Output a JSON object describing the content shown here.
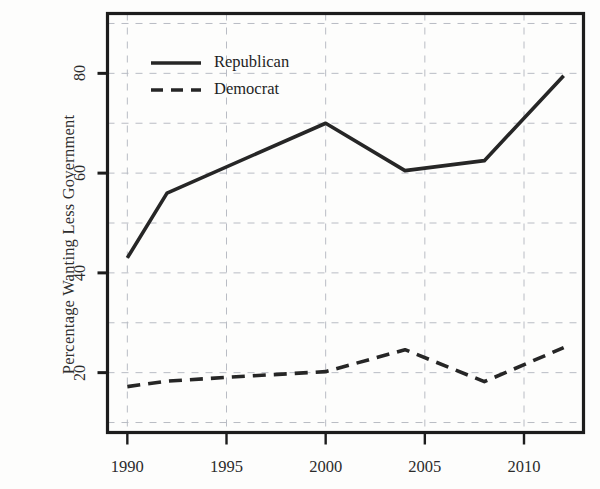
{
  "chart_data": {
    "type": "line",
    "title": "",
    "xlabel": "",
    "ylabel": "Percentage Wanting Less Government",
    "xlim": [
      1989,
      2013
    ],
    "ylim": [
      8,
      92
    ],
    "xticks": [
      1990,
      1995,
      2000,
      2005,
      2010
    ],
    "xtick_labels": [
      "1990",
      "1995",
      "2000",
      "2005",
      "2010"
    ],
    "yticks": [
      20,
      40,
      60,
      80
    ],
    "ytick_labels": [
      "20",
      "40",
      "60",
      "80"
    ],
    "gridlines_x": [
      1990,
      1995,
      2000,
      2005,
      2010
    ],
    "gridlines_y": [
      10,
      20,
      30,
      40,
      50,
      60,
      70,
      80,
      90
    ],
    "grid": true,
    "grid_style": "dashed",
    "grid_color": "#b9bcc4",
    "frame_color": "#1c1c1c",
    "legend_position": "top-left-inside",
    "series": [
      {
        "name": "Republican",
        "style": "solid",
        "color": "#262626",
        "x": [
          1990,
          1992,
          2000,
          2004,
          2008,
          2012
        ],
        "values": [
          43,
          56,
          70,
          60.5,
          62.5,
          79.5
        ]
      },
      {
        "name": "Democrat",
        "style": "dashed",
        "color": "#262626",
        "x": [
          1990,
          1992,
          1996,
          2000,
          2004,
          2008,
          2012
        ],
        "values": [
          17.2,
          18.3,
          19.3,
          20.2,
          24.6,
          18.2,
          25
        ]
      }
    ]
  },
  "legend": {
    "items": [
      {
        "label": "Republican",
        "style": "solid"
      },
      {
        "label": "Democrat",
        "style": "dashed"
      }
    ]
  },
  "axes": {
    "y_title": "Percentage Wanting Less Government"
  }
}
